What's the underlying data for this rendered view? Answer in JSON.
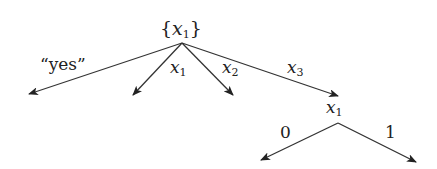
{
  "diagram": {
    "type": "tree",
    "root": {
      "label_open": "{",
      "var": "x",
      "sub": "1",
      "label_close": "}"
    },
    "root_edges": [
      {
        "label": "“yes”"
      },
      {
        "var": "x",
        "sub": "1"
      },
      {
        "var": "x",
        "sub": "2"
      },
      {
        "var": "x",
        "sub": "3"
      }
    ],
    "child_node": {
      "var": "x",
      "sub": "1"
    },
    "child_edges": [
      {
        "label": "0"
      },
      {
        "label": "1"
      }
    ],
    "colors": {
      "line": "#333333",
      "text": "#222222"
    }
  }
}
